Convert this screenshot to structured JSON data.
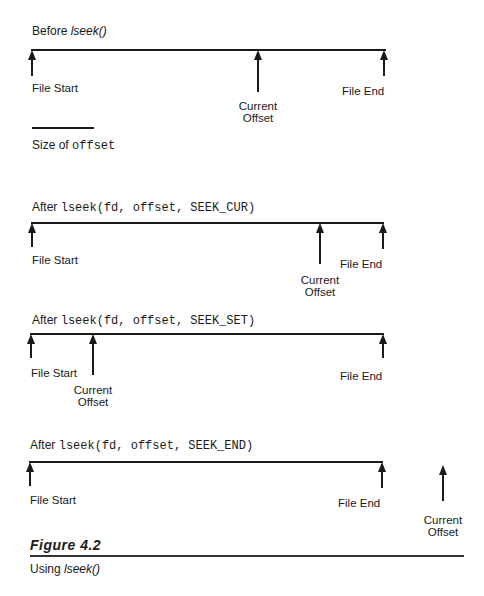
{
  "panels": [
    {
      "title_prefix": "Before ",
      "title_call": "lseek()",
      "labels": {
        "start": "File Start",
        "end": "File End",
        "cur1": "Current",
        "cur2": "Offset"
      }
    },
    {
      "title_prefix": "After ",
      "title_call": "lseek(fd, offset, SEEK_CUR)",
      "labels": {
        "start": "File Start",
        "end": "File End",
        "cur1": "Current",
        "cur2": "Offset"
      }
    },
    {
      "title_prefix": "After ",
      "title_call": "lseek(fd, offset, SEEK_SET)",
      "labels": {
        "start": "File Start",
        "end": "File End",
        "cur1": "Current",
        "cur2": "Offset"
      }
    },
    {
      "title_prefix": "After ",
      "title_call": "lseek(fd, offset, SEEK_END)",
      "labels": {
        "start": "File Start",
        "end": "File End",
        "cur1": "Current",
        "cur2": "Offset"
      }
    }
  ],
  "legend": {
    "prefix": "Size of ",
    "code": "offset"
  },
  "figure": {
    "number": "Figure 4.2",
    "caption_prefix": "Using ",
    "caption_call": "lseek()"
  }
}
